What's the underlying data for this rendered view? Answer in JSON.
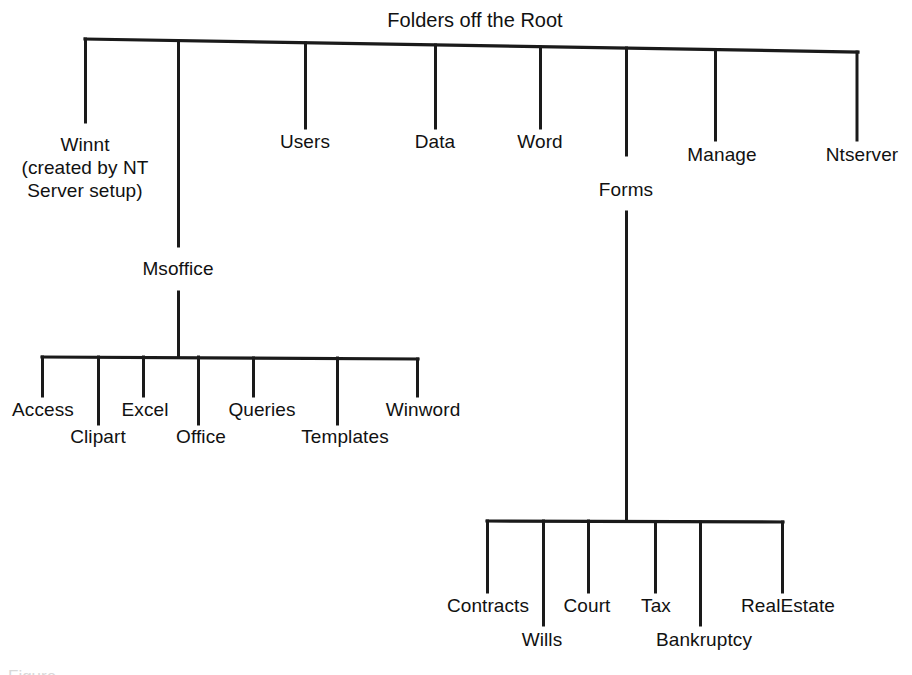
{
  "figure": {
    "type": "tree-diagram",
    "title": "Folders off the Root",
    "background_color": "#ffffff",
    "line_color": "#1a1a1a",
    "text_color": "#111111",
    "caption_partial": "Figure"
  },
  "tree": {
    "root": {
      "label": "Folders off the Root"
    },
    "level1": [
      {
        "label": "Winnt",
        "note_line2": "(created by NT",
        "note_line3": "Server setup)"
      },
      {
        "label": "Msoffice"
      },
      {
        "label": "Users"
      },
      {
        "label": "Data"
      },
      {
        "label": "Word"
      },
      {
        "label": "Forms"
      },
      {
        "label": "Manage"
      },
      {
        "label": "Ntserver"
      }
    ],
    "msoffice_children": [
      {
        "label": "Access"
      },
      {
        "label": "Clipart"
      },
      {
        "label": "Excel"
      },
      {
        "label": "Office"
      },
      {
        "label": "Queries"
      },
      {
        "label": "Templates"
      },
      {
        "label": "Winword"
      }
    ],
    "forms_children": [
      {
        "label": "Contracts"
      },
      {
        "label": "Wills"
      },
      {
        "label": "Court"
      },
      {
        "label": "Tax"
      },
      {
        "label": "Bankruptcy"
      },
      {
        "label": "RealEstate"
      }
    ]
  }
}
